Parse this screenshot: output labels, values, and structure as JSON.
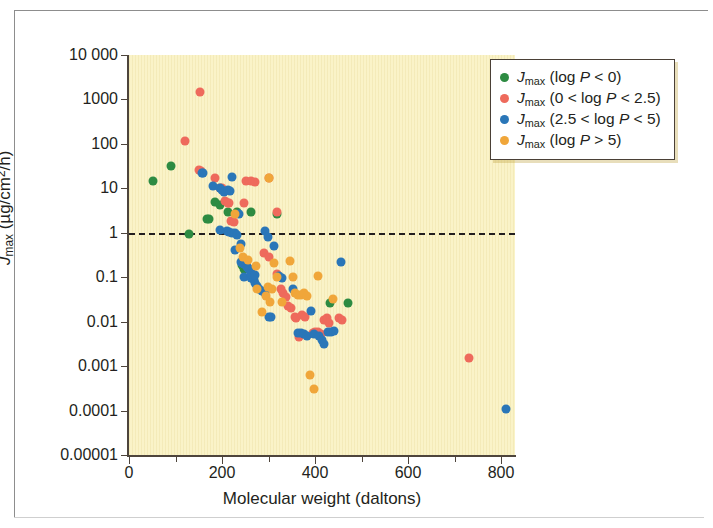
{
  "figure": {
    "background_color": "#ffffff",
    "plot_background_color": "#faf3c8",
    "axis_color": "#4e453c"
  },
  "axes": {
    "x_title": "Molecular weight (daltons)",
    "y_title_prefix": "J",
    "y_title_sub": "max",
    "y_title_units_a": " (µg/cm",
    "y_title_sup": "2",
    "y_title_units_b": "/h)",
    "x_ticks": [
      "0",
      "200",
      "400",
      "600",
      "800"
    ],
    "y_ticks": [
      "10 000",
      "1000",
      "100",
      "10",
      "1",
      "0.1",
      "0.01",
      "0.001",
      "0.0001",
      "0.00001"
    ]
  },
  "legend": {
    "items": [
      {
        "color": "#2d8b42",
        "symbol_prefix": "J",
        "symbol_sub": "max",
        "condition": " (log P < 0)",
        "label": "Jmax (log P < 0)"
      },
      {
        "color": "#ee6a5c",
        "symbol_prefix": "J",
        "symbol_sub": "max",
        "condition": " (0 < log P < 2.5)",
        "label": "Jmax (0 < log P < 2.5)"
      },
      {
        "color": "#2a76b8",
        "symbol_prefix": "J",
        "symbol_sub": "max",
        "condition": " (2.5 < log P < 5)",
        "label": "Jmax (2.5 < log P < 5)"
      },
      {
        "color": "#f0a63a",
        "symbol_prefix": "J",
        "symbol_sub": "max",
        "condition": " (log P > 5)",
        "label": "Jmax (log P > 5)"
      }
    ]
  },
  "annotations": {
    "threshold": {
      "value": 1,
      "style": "dashed",
      "color": "#231f20"
    }
  },
  "chart_data": {
    "type": "scatter",
    "title": "",
    "xlabel": "Molecular weight (daltons)",
    "ylabel": "Jmax (µg/cm2/h)",
    "xlim": [
      0,
      830
    ],
    "ylim": [
      1e-05,
      10000
    ],
    "yscale": "log",
    "grid": false,
    "legend_position": "top-right",
    "annotations": [
      {
        "type": "hline",
        "y": 1,
        "style": "dashed",
        "label": ""
      }
    ],
    "series": [
      {
        "name": "Jmax (log P < 0)",
        "color": "#2d8b42",
        "points": [
          [
            52,
            15
          ],
          [
            90,
            32
          ],
          [
            128,
            0.92
          ],
          [
            168,
            2.0
          ],
          [
            172,
            2.0
          ],
          [
            185,
            5.0
          ],
          [
            196,
            4.3
          ],
          [
            212,
            3.0
          ],
          [
            232,
            2.9
          ],
          [
            247,
            0.15
          ],
          [
            243,
            0.19
          ],
          [
            262,
            2.9
          ],
          [
            318,
            2.6
          ],
          [
            432,
            0.026
          ],
          [
            470,
            0.026
          ]
        ]
      },
      {
        "name": "Jmax (0 < log P < 2.5)",
        "color": "#ee6a5c",
        "points": [
          [
            152,
            1500
          ],
          [
            120,
            115
          ],
          [
            150,
            26
          ],
          [
            154,
            25
          ],
          [
            185,
            17
          ],
          [
            196,
            10
          ],
          [
            200,
            10
          ],
          [
            206,
            5.2
          ],
          [
            212,
            4.6
          ],
          [
            214,
            4.8
          ],
          [
            220,
            1.8
          ],
          [
            225,
            1.75
          ],
          [
            248,
            4.8
          ],
          [
            252,
            15
          ],
          [
            262,
            15
          ],
          [
            270,
            14
          ],
          [
            300,
            17
          ],
          [
            318,
            3.0
          ],
          [
            290,
            0.35
          ],
          [
            302,
            0.28
          ],
          [
            318,
            0.12
          ],
          [
            326,
            0.055
          ],
          [
            332,
            0.045
          ],
          [
            338,
            0.035
          ],
          [
            342,
            0.022
          ],
          [
            348,
            0.02
          ],
          [
            358,
            0.013
          ],
          [
            360,
            0.012
          ],
          [
            366,
            0.0045
          ],
          [
            372,
            0.014
          ],
          [
            378,
            0.013
          ],
          [
            396,
            0.0055
          ],
          [
            400,
            0.0058
          ],
          [
            406,
            0.0058
          ],
          [
            412,
            0.0052
          ],
          [
            420,
            0.011
          ],
          [
            426,
            0.012
          ],
          [
            430,
            0.0095
          ],
          [
            452,
            0.012
          ],
          [
            458,
            0.011
          ],
          [
            732,
            0.0015
          ]
        ]
      },
      {
        "name": "Jmax (2.5 < log P < 5)",
        "color": "#2a76b8",
        "points": [
          [
            156,
            22
          ],
          [
            160,
            22
          ],
          [
            180,
            11
          ],
          [
            196,
            10
          ],
          [
            200,
            9.0
          ],
          [
            204,
            8.2
          ],
          [
            212,
            9.0
          ],
          [
            218,
            8.5
          ],
          [
            222,
            18
          ],
          [
            236,
            2.6
          ],
          [
            196,
            1.15
          ],
          [
            210,
            1.1
          ],
          [
            214,
            1.05
          ],
          [
            222,
            1.0
          ],
          [
            228,
            0.98
          ],
          [
            232,
            0.9
          ],
          [
            240,
            0.55
          ],
          [
            228,
            0.42
          ],
          [
            240,
            0.22
          ],
          [
            244,
            0.21
          ],
          [
            248,
            0.2
          ],
          [
            252,
            0.19
          ],
          [
            254,
            0.17
          ],
          [
            256,
            0.16
          ],
          [
            258,
            0.15
          ],
          [
            262,
            0.13
          ],
          [
            248,
            0.1
          ],
          [
            262,
            0.098
          ],
          [
            268,
            0.085
          ],
          [
            272,
            0.075
          ],
          [
            276,
            0.062
          ],
          [
            280,
            0.055
          ],
          [
            286,
            0.048
          ],
          [
            292,
            0.045
          ],
          [
            262,
            0.12
          ],
          [
            270,
            0.11
          ],
          [
            300,
            0.0125
          ],
          [
            306,
            0.013
          ],
          [
            312,
            0.5
          ],
          [
            322,
            0.105
          ],
          [
            330,
            0.095
          ],
          [
            352,
            0.055
          ],
          [
            364,
            0.0055
          ],
          [
            370,
            0.0055
          ],
          [
            376,
            0.0052
          ],
          [
            382,
            0.0048
          ],
          [
            392,
            0.017
          ],
          [
            398,
            0.0052
          ],
          [
            408,
            0.0048
          ],
          [
            414,
            0.0038
          ],
          [
            420,
            0.0032
          ],
          [
            428,
            0.0058
          ],
          [
            434,
            0.006
          ],
          [
            440,
            0.0062
          ],
          [
            292,
            1.1
          ],
          [
            298,
            0.8
          ],
          [
            456,
            0.22
          ],
          [
            810,
            0.00011
          ]
        ]
      },
      {
        "name": "Jmax (log P > 5)",
        "color": "#f0a63a",
        "points": [
          [
            228,
            2.6
          ],
          [
            238,
            0.45
          ],
          [
            246,
            0.28
          ],
          [
            256,
            0.25
          ],
          [
            274,
            0.18
          ],
          [
            276,
            0.055
          ],
          [
            286,
            0.0165
          ],
          [
            294,
            0.038
          ],
          [
            298,
            0.06
          ],
          [
            304,
            0.027
          ],
          [
            308,
            0.055
          ],
          [
            312,
            0.21
          ],
          [
            318,
            0.1
          ],
          [
            330,
            0.027
          ],
          [
            346,
            0.23
          ],
          [
            352,
            0.1
          ],
          [
            358,
            0.045
          ],
          [
            364,
            0.04
          ],
          [
            370,
            0.04
          ],
          [
            376,
            0.045
          ],
          [
            382,
            0.038
          ],
          [
            390,
            0.00062
          ],
          [
            398,
            0.0003
          ],
          [
            300,
            17
          ],
          [
            406,
            0.105
          ],
          [
            438,
            0.033
          ]
        ]
      }
    ]
  }
}
